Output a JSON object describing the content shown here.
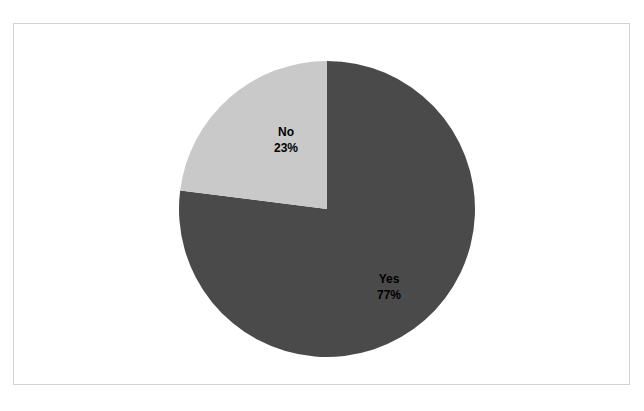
{
  "page": {
    "background_color": "#ffffff",
    "width": 644,
    "height": 411
  },
  "clipped_header_text": "                                                                                                                          ",
  "figure": {
    "frame_border_color": "#d2d2d2",
    "background_color": "#ffffff"
  },
  "chart_data": {
    "type": "pie",
    "title": "",
    "subtitle": "",
    "xlabel": "",
    "ylabel": "",
    "categories": [
      "Yes",
      "No"
    ],
    "values": [
      77,
      23
    ],
    "value_unit": "%",
    "slices": [
      {
        "label": "Yes",
        "value": 77,
        "value_text": "77%",
        "color": "#4a4a4a",
        "start_angle_deg": 0,
        "end_angle_deg": 277.2
      },
      {
        "label": "No",
        "value": 23,
        "value_text": "23%",
        "color": "#c9c9c9",
        "start_angle_deg": 277.2,
        "end_angle_deg": 360
      }
    ],
    "start_angle_deg": 0,
    "direction": "clockwise",
    "legend": false,
    "legend_position": "none",
    "grid": false,
    "data_labels_inside": true,
    "center_x": 326,
    "center_y": 208,
    "radius": 148
  },
  "labels": {
    "no": {
      "name": "No",
      "value_text": "23%",
      "color": "#000000"
    },
    "yes": {
      "name": "Yes",
      "value_text": "77%",
      "color": "#000000"
    }
  }
}
